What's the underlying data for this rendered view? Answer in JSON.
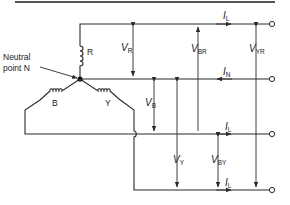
{
  "diagram": {
    "neutral_label_line1": "Neutral",
    "neutral_label_line2": "point N",
    "phases": {
      "R": "R",
      "B": "B",
      "Y": "Y"
    },
    "currents": {
      "line_R": {
        "sym": "I",
        "sub": "L"
      },
      "neutral": {
        "sym": "I",
        "sub": "N"
      },
      "line_B": {
        "sym": "I",
        "sub": "L"
      },
      "line_Y": {
        "sym": "I",
        "sub": "L"
      }
    },
    "voltages": {
      "VR": {
        "sym": "V",
        "sub": "R"
      },
      "VBR": {
        "sym": "V",
        "sub": "BR"
      },
      "VYR": {
        "sym": "V",
        "sub": "YR"
      },
      "VB": {
        "sym": "V",
        "sub": "B"
      },
      "VY": {
        "sym": "V",
        "sub": "Y"
      },
      "VBY": {
        "sym": "V",
        "sub": "BY"
      }
    },
    "colors": {
      "line": "#2a2a2a",
      "background": "#ffffff"
    }
  }
}
